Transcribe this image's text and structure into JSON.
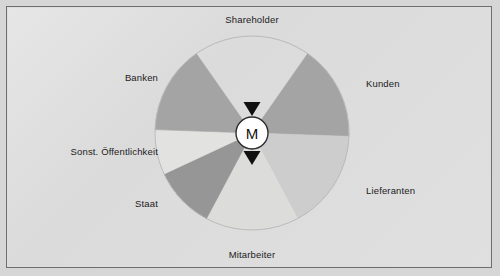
{
  "diagram": {
    "hub": {
      "letter": "M",
      "name": "hub-circle"
    },
    "arrows": {
      "top": "triangle-down-icon",
      "bottom": "triangle-down-icon"
    },
    "segments": [
      {
        "id": "shareholder",
        "label": "Shareholder",
        "color": "#f4f4f2",
        "start_angle": -55,
        "end_angle": -125,
        "label_x": 252,
        "label_y": 14,
        "label_align": "center"
      },
      {
        "id": "kunden",
        "label": "Kunden",
        "color": "#a4a4a4",
        "start_angle": -55,
        "end_angle": 2,
        "label_x": 366,
        "label_y": 78,
        "label_align": "left"
      },
      {
        "id": "lieferanten",
        "label": "Lieferanten",
        "color": "#cdcdcd",
        "start_angle": 2,
        "end_angle": 62,
        "label_x": 366,
        "label_y": 185,
        "label_align": "left"
      },
      {
        "id": "mitarbeiter",
        "label": "Mitarbeiter",
        "color": "#dcdcda",
        "start_angle": 62,
        "end_angle": 118,
        "label_x": 252,
        "label_y": 249,
        "label_align": "center"
      },
      {
        "id": "staat",
        "label": "Staat",
        "color": "#969696",
        "start_angle": 118,
        "end_angle": 155,
        "label_x": 158,
        "label_y": 198,
        "label_align": "right"
      },
      {
        "id": "sonst-oeffentlichkeit",
        "label": "Sonst. Öffentlichkeit",
        "color": "#e2e2e0",
        "start_angle": 155,
        "end_angle": 182,
        "label_x": 158,
        "label_y": 146,
        "label_align": "right"
      },
      {
        "id": "banken",
        "label": "Banken",
        "color": "#a4a4a4",
        "start_angle": 182,
        "end_angle": 235,
        "label_x": 158,
        "label_y": 72,
        "label_align": "right"
      }
    ],
    "geometry": {
      "center_x": 252,
      "center_y": 133,
      "radius": 97,
      "hub_radius": 16
    },
    "colors": {
      "background": "#d6d6d6",
      "frame_border": "#6e6e6e",
      "hub_fill": "#ffffff",
      "hub_stroke": "#2b2b2b",
      "arrow_fill": "#111111",
      "wheel_stroke": "#b9b9b9",
      "text": "#1b1b1b"
    }
  }
}
